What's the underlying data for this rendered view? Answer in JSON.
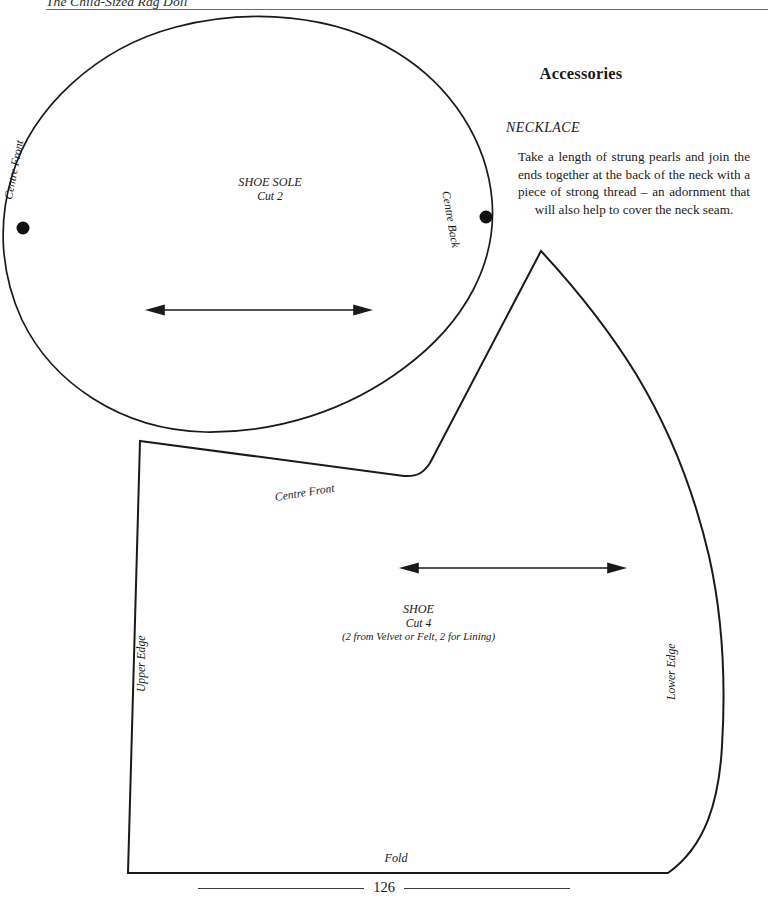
{
  "page": {
    "running_head": "The Child-Sized Rag Doll",
    "page_number": "126",
    "ink_color": "#1a1a1a",
    "paper_color": "#ffffff",
    "rule_color": "#6b6b6b"
  },
  "accessories": {
    "heading": "Accessories",
    "necklace": {
      "heading": "NECKLACE",
      "body": "Take a length of strung pearls and join the ends together at the back of the neck with a piece of strong thread – an adornment that will also help to cover the neck seam."
    }
  },
  "patterns": {
    "sole": {
      "name_line": "SHOE SOLE",
      "cut_line": "Cut 2",
      "centre_front_label": "Centre Front",
      "centre_back_label": "Centre Back",
      "grain_arrow": "double-headed-grain-arrow"
    },
    "shoe": {
      "name_line": "SHOE",
      "cut_line": "Cut 4",
      "fabric_line": "(2 from Velvet or Felt, 2 for Lining)",
      "centre_front_label": "Centre Front",
      "upper_edge_label": "Upper Edge",
      "lower_edge_label": "Lower Edge",
      "fold_label": "Fold",
      "grain_arrow": "double-headed-grain-arrow"
    }
  }
}
